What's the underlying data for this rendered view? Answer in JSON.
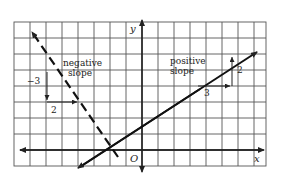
{
  "figure": {
    "axes": {
      "x_label": "x",
      "y_label": "y",
      "origin_label": "O"
    },
    "lines": [
      {
        "name": "negative-slope-line",
        "style": "dashed",
        "label_line1": "negative",
        "label_line2": "slope",
        "rise_label": "−3",
        "run_label": "2"
      },
      {
        "name": "positive-slope-line",
        "style": "solid",
        "label_line1": "positive",
        "label_line2": "slope",
        "run_label": "3",
        "rise_label": "2"
      }
    ]
  }
}
